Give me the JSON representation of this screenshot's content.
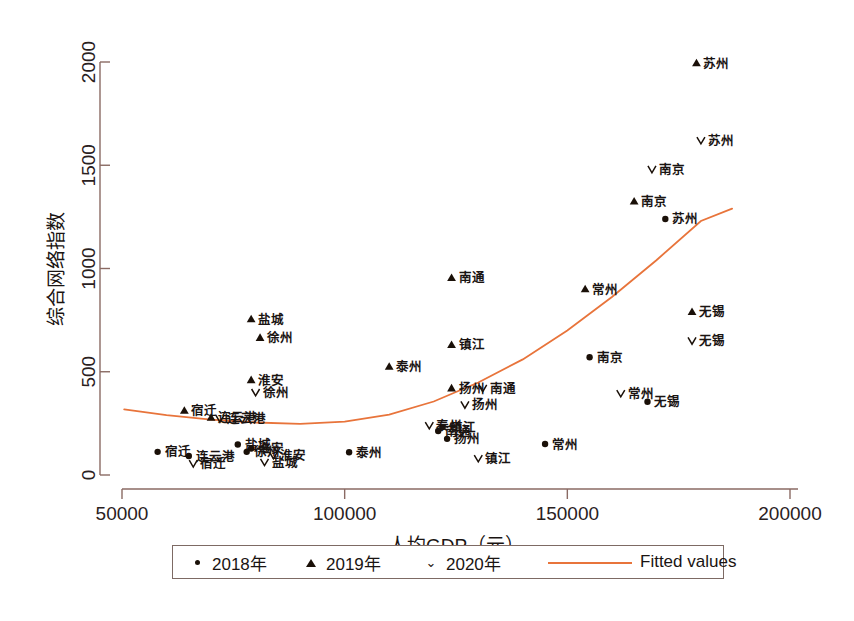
{
  "chart_data": {
    "type": "scatter",
    "title": "",
    "xlabel": "人均GDP（元）",
    "ylabel": "综合网络指数",
    "xlim": [
      50000,
      200000
    ],
    "ylim": [
      0,
      2000
    ],
    "xticks": [
      50000,
      100000,
      150000,
      200000
    ],
    "yticks": [
      0,
      500,
      1000,
      1500,
      2000
    ],
    "xtick_labels": [
      "50000",
      "100000",
      "150000",
      "200000"
    ],
    "ytick_labels": [
      "0",
      "500",
      "1000",
      "1500",
      "2000"
    ],
    "grid": false,
    "legend_position": "bottom",
    "marker_color": "#1a1008",
    "fit_color": "#e8743b",
    "axis_color": "#8a6a63",
    "series": [
      {
        "name": "2018年",
        "marker": "circle",
        "points": [
          {
            "label": "苏州",
            "x": 172000,
            "y": 1240
          },
          {
            "label": "南京",
            "x": 155000,
            "y": 570
          },
          {
            "label": "无锡",
            "x": 168000,
            "y": 355
          },
          {
            "label": "常州",
            "x": 145000,
            "y": 150
          },
          {
            "label": "镇江",
            "x": 122000,
            "y": 232
          },
          {
            "label": "南通",
            "x": 121000,
            "y": 213
          },
          {
            "label": "扬州",
            "x": 123000,
            "y": 175
          },
          {
            "label": "泰州",
            "x": 101000,
            "y": 110
          },
          {
            "label": "宿迁",
            "x": 58000,
            "y": 112
          },
          {
            "label": "连云港",
            "x": 65000,
            "y": 92
          },
          {
            "label": "盐城",
            "x": 76000,
            "y": 148
          },
          {
            "label": "淮安",
            "x": 79000,
            "y": 128
          },
          {
            "label": "徐州",
            "x": 78000,
            "y": 112
          }
        ]
      },
      {
        "name": "2019年",
        "marker": "triangle",
        "points": [
          {
            "label": "苏州",
            "x": 179000,
            "y": 1995
          },
          {
            "label": "南京",
            "x": 165000,
            "y": 1325
          },
          {
            "label": "常州",
            "x": 154000,
            "y": 900
          },
          {
            "label": "无锡",
            "x": 178000,
            "y": 790
          },
          {
            "label": "南通",
            "x": 124000,
            "y": 955
          },
          {
            "label": "盐城",
            "x": 79000,
            "y": 755
          },
          {
            "label": "徐州",
            "x": 81000,
            "y": 665
          },
          {
            "label": "镇江",
            "x": 124000,
            "y": 630
          },
          {
            "label": "泰州",
            "x": 110000,
            "y": 525
          },
          {
            "label": "淮安",
            "x": 79000,
            "y": 460
          },
          {
            "label": "扬州",
            "x": 124000,
            "y": 420
          },
          {
            "label": "宿迁",
            "x": 64000,
            "y": 312
          },
          {
            "label": "连云港",
            "x": 70000,
            "y": 278
          }
        ]
      },
      {
        "name": "2020年",
        "marker": "vee",
        "points": [
          {
            "label": "苏州",
            "x": 180000,
            "y": 1620
          },
          {
            "label": "南京",
            "x": 169000,
            "y": 1480
          },
          {
            "label": "无锡",
            "x": 178000,
            "y": 650
          },
          {
            "label": "常州",
            "x": 162000,
            "y": 395
          },
          {
            "label": "南通",
            "x": 131000,
            "y": 420
          },
          {
            "label": "扬州",
            "x": 127000,
            "y": 340
          },
          {
            "label": "徐州",
            "x": 80000,
            "y": 400
          },
          {
            "label": "连云港",
            "x": 72000,
            "y": 272
          },
          {
            "label": "泰州",
            "x": 119000,
            "y": 240
          },
          {
            "label": "镇江",
            "x": 130000,
            "y": 80
          },
          {
            "label": "淮安",
            "x": 84000,
            "y": 95
          },
          {
            "label": "盐城",
            "x": 82000,
            "y": 62
          },
          {
            "label": "宿迁",
            "x": 66000,
            "y": 55
          }
        ]
      }
    ],
    "fit": {
      "name": "Fitted values",
      "type": "quadratic",
      "points": [
        {
          "x": 50500,
          "y": 318
        },
        {
          "x": 60000,
          "y": 290
        },
        {
          "x": 70000,
          "y": 268
        },
        {
          "x": 80000,
          "y": 254
        },
        {
          "x": 90000,
          "y": 248
        },
        {
          "x": 100000,
          "y": 258
        },
        {
          "x": 110000,
          "y": 292
        },
        {
          "x": 120000,
          "y": 356
        },
        {
          "x": 130000,
          "y": 448
        },
        {
          "x": 140000,
          "y": 560
        },
        {
          "x": 150000,
          "y": 700
        },
        {
          "x": 160000,
          "y": 862
        },
        {
          "x": 170000,
          "y": 1040
        },
        {
          "x": 180000,
          "y": 1230
        },
        {
          "x": 187000,
          "y": 1290
        }
      ]
    }
  },
  "legend": {
    "items": [
      {
        "label": "2018年",
        "marker": "circle"
      },
      {
        "label": "2019年",
        "marker": "triangle"
      },
      {
        "label": "2020年",
        "marker": "vee"
      },
      {
        "label": "Fitted values",
        "marker": "line"
      }
    ]
  }
}
